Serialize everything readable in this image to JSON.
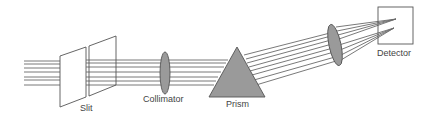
{
  "diagram": {
    "components": [
      {
        "id": "slit",
        "label": "Slit"
      },
      {
        "id": "collimator",
        "label": "Collimator"
      },
      {
        "id": "prism",
        "label": "Prism"
      },
      {
        "id": "focusing-lens",
        "label": ""
      },
      {
        "id": "detector",
        "label": "Detector"
      }
    ],
    "labels": {
      "slit": "Slit",
      "collimator": "Collimator",
      "prism": "Prism",
      "detector": "Detector"
    },
    "colors": {
      "line": "#555555",
      "beam": "#6a6a6a",
      "optic_fill": "#9a9a9a",
      "text": "#444444",
      "background": "#ffffff"
    }
  }
}
